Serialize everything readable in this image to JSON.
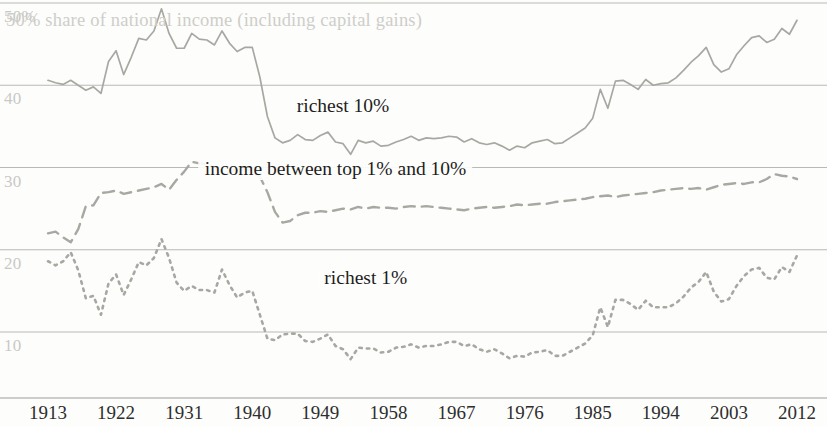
{
  "chart_data": {
    "type": "line",
    "title": "50% share of national income (including capital gains)",
    "xlabel": "",
    "ylabel": "",
    "xlim": [
      1913,
      2013
    ],
    "ylim": [
      6.5,
      50.5
    ],
    "grid": true,
    "gridlines_y": [
      50,
      40,
      30,
      20,
      10
    ],
    "ytick_labels": [
      "50%",
      "40",
      "30",
      "20",
      "10"
    ],
    "xtick_labels": [
      "1913",
      "1922",
      "1931",
      "1940",
      "1949",
      "1958",
      "1967",
      "1976",
      "1985",
      "1994",
      "2003",
      "2012"
    ],
    "xticks": [
      1913,
      1922,
      1931,
      1940,
      1949,
      1958,
      1967,
      1976,
      1985,
      1994,
      2003,
      2012
    ],
    "legend_position": "inline-annotations",
    "line_color": "#a8a8a3",
    "series": [
      {
        "name": "richest 10%",
        "style": "solid",
        "label_x": 1952,
        "label_y": 37.2,
        "x": [
          1913,
          1914,
          1915,
          1916,
          1917,
          1918,
          1919,
          1920,
          1921,
          1922,
          1923,
          1924,
          1925,
          1926,
          1927,
          1928,
          1929,
          1930,
          1931,
          1932,
          1933,
          1934,
          1935,
          1936,
          1937,
          1938,
          1939,
          1940,
          1941,
          1942,
          1943,
          1944,
          1945,
          1946,
          1947,
          1948,
          1949,
          1950,
          1951,
          1952,
          1953,
          1954,
          1955,
          1956,
          1957,
          1958,
          1959,
          1960,
          1961,
          1962,
          1963,
          1964,
          1965,
          1966,
          1967,
          1968,
          1969,
          1970,
          1971,
          1972,
          1973,
          1974,
          1975,
          1976,
          1977,
          1978,
          1979,
          1980,
          1981,
          1982,
          1983,
          1984,
          1985,
          1986,
          1987,
          1988,
          1989,
          1990,
          1991,
          1992,
          1993,
          1994,
          1995,
          1996,
          1997,
          1998,
          1999,
          2000,
          2001,
          2002,
          2003,
          2004,
          2005,
          2006,
          2007,
          2008,
          2009,
          2010,
          2011,
          2012
        ],
        "y": [
          40.6,
          40.3,
          40.1,
          40.6,
          40.0,
          39.4,
          39.8,
          39.0,
          42.9,
          44.2,
          41.3,
          43.4,
          45.7,
          45.5,
          46.6,
          49.3,
          46.3,
          44.5,
          44.5,
          46.3,
          45.6,
          45.5,
          44.9,
          46.6,
          45.1,
          44.1,
          44.6,
          44.6,
          41.0,
          36.2,
          33.6,
          33.0,
          33.3,
          34.0,
          33.4,
          33.3,
          33.9,
          34.3,
          33.1,
          32.9,
          31.6,
          33.3,
          33.0,
          33.2,
          32.6,
          32.7,
          33.1,
          33.4,
          33.8,
          33.3,
          33.6,
          33.5,
          33.6,
          33.8,
          33.7,
          33.1,
          33.5,
          33.0,
          32.8,
          33.0,
          32.6,
          32.1,
          32.6,
          32.4,
          33.0,
          33.2,
          33.4,
          32.9,
          33.0,
          33.6,
          34.2,
          34.8,
          36.0,
          39.5,
          37.2,
          40.5,
          40.6,
          40.1,
          39.5,
          40.7,
          40.0,
          40.2,
          40.3,
          40.9,
          41.8,
          42.8,
          43.6,
          44.6,
          42.5,
          41.6,
          42.0,
          43.7,
          44.8,
          45.8,
          46.0,
          45.2,
          45.6,
          46.9,
          46.2,
          47.9
        ]
      },
      {
        "name": "income between top 1% and 10%",
        "style": "dashed",
        "label_x": 1951,
        "label_y": 29.6,
        "x": [
          1913,
          1914,
          1915,
          1916,
          1917,
          1918,
          1919,
          1920,
          1921,
          1922,
          1923,
          1924,
          1925,
          1926,
          1927,
          1928,
          1929,
          1930,
          1931,
          1932,
          1933,
          1934,
          1935,
          1936,
          1937,
          1938,
          1939,
          1940,
          1941,
          1942,
          1943,
          1944,
          1945,
          1946,
          1947,
          1948,
          1949,
          1950,
          1951,
          1952,
          1953,
          1954,
          1955,
          1956,
          1957,
          1958,
          1959,
          1960,
          1961,
          1962,
          1963,
          1964,
          1965,
          1966,
          1967,
          1968,
          1969,
          1970,
          1971,
          1972,
          1973,
          1974,
          1975,
          1976,
          1977,
          1978,
          1979,
          1980,
          1981,
          1982,
          1983,
          1984,
          1985,
          1986,
          1987,
          1988,
          1989,
          1990,
          1991,
          1992,
          1993,
          1994,
          1995,
          1996,
          1997,
          1998,
          1999,
          2000,
          2001,
          2002,
          2003,
          2004,
          2005,
          2006,
          2007,
          2008,
          2009,
          2010,
          2011,
          2012
        ],
        "y": [
          22.0,
          22.2,
          21.5,
          20.9,
          22.5,
          25.3,
          25.4,
          26.9,
          27.0,
          27.2,
          26.8,
          27.0,
          27.2,
          27.4,
          27.6,
          28.0,
          27.3,
          28.5,
          29.5,
          30.7,
          30.5,
          30.4,
          30.1,
          29.0,
          29.4,
          29.9,
          29.8,
          29.6,
          28.9,
          27.0,
          24.6,
          23.3,
          23.5,
          24.2,
          24.5,
          24.5,
          24.7,
          24.6,
          24.8,
          25.0,
          24.9,
          25.2,
          25.0,
          25.2,
          25.1,
          25.1,
          25.0,
          25.2,
          25.3,
          25.2,
          25.3,
          25.2,
          25.1,
          25.0,
          24.9,
          24.8,
          25.0,
          25.1,
          25.2,
          25.1,
          25.2,
          25.3,
          25.5,
          25.4,
          25.5,
          25.6,
          25.6,
          25.8,
          25.9,
          26.0,
          26.1,
          26.2,
          26.4,
          26.5,
          26.6,
          26.4,
          26.6,
          26.7,
          26.8,
          26.9,
          27.0,
          27.2,
          27.3,
          27.4,
          27.5,
          27.4,
          27.5,
          27.3,
          27.6,
          27.9,
          28.0,
          28.1,
          28.0,
          28.2,
          28.2,
          28.6,
          29.2,
          29.0,
          28.9,
          28.6
        ]
      },
      {
        "name": "richest 1%",
        "style": "dotted",
        "label_x": 1955,
        "label_y": 16.3,
        "x": [
          1913,
          1914,
          1915,
          1916,
          1917,
          1918,
          1919,
          1920,
          1921,
          1922,
          1923,
          1924,
          1925,
          1926,
          1927,
          1928,
          1929,
          1930,
          1931,
          1932,
          1933,
          1934,
          1935,
          1936,
          1937,
          1938,
          1939,
          1940,
          1941,
          1942,
          1943,
          1944,
          1945,
          1946,
          1947,
          1948,
          1949,
          1950,
          1951,
          1952,
          1953,
          1954,
          1955,
          1956,
          1957,
          1958,
          1959,
          1960,
          1961,
          1962,
          1963,
          1964,
          1965,
          1966,
          1967,
          1968,
          1969,
          1970,
          1971,
          1972,
          1973,
          1974,
          1975,
          1976,
          1977,
          1978,
          1979,
          1980,
          1981,
          1982,
          1983,
          1984,
          1985,
          1986,
          1987,
          1988,
          1989,
          1990,
          1991,
          1992,
          1993,
          1994,
          1995,
          1996,
          1997,
          1998,
          1999,
          2000,
          2001,
          2002,
          2003,
          2004,
          2005,
          2006,
          2007,
          2008,
          2009,
          2010,
          2011,
          2012
        ],
        "y": [
          18.6,
          18.1,
          18.6,
          19.7,
          17.5,
          14.1,
          14.4,
          12.1,
          15.9,
          17.0,
          14.5,
          16.4,
          18.5,
          18.1,
          19.0,
          21.3,
          19.0,
          16.0,
          15.0,
          15.6,
          15.1,
          15.1,
          14.8,
          17.6,
          15.7,
          14.2,
          14.8,
          15.0,
          12.1,
          9.2,
          9.0,
          9.7,
          9.8,
          9.8,
          8.9,
          8.8,
          9.2,
          9.7,
          8.3,
          7.9,
          6.7,
          8.1,
          8.0,
          8.0,
          7.5,
          7.6,
          8.1,
          8.2,
          8.5,
          8.1,
          8.3,
          8.3,
          8.5,
          8.8,
          8.8,
          8.3,
          8.5,
          7.9,
          7.6,
          7.9,
          7.4,
          6.8,
          7.1,
          7.0,
          7.5,
          7.6,
          7.8,
          7.1,
          7.1,
          7.6,
          8.1,
          8.6,
          9.6,
          13.0,
          10.6,
          13.9,
          13.9,
          13.4,
          12.7,
          13.8,
          13.0,
          13.0,
          13.0,
          13.5,
          14.3,
          15.4,
          16.1,
          17.3,
          14.9,
          13.7,
          14.0,
          15.6,
          16.8,
          17.6,
          17.8,
          16.6,
          16.4,
          17.9,
          17.3,
          19.3
        ]
      }
    ]
  },
  "axis": {
    "y_labels": [
      {
        "text": "50%",
        "value": 50
      },
      {
        "text": "40",
        "value": 40
      },
      {
        "text": "30",
        "value": 30
      },
      {
        "text": "20",
        "value": 20
      },
      {
        "text": "10",
        "value": 10
      }
    ]
  }
}
